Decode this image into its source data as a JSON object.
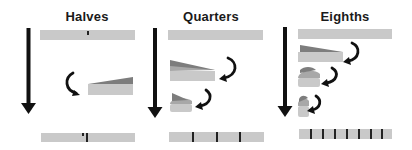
{
  "panels": [
    {
      "id": "halves",
      "title": "Halves",
      "divisions": 2
    },
    {
      "id": "quarters",
      "title": "Quarters",
      "divisions": 4
    },
    {
      "id": "eighths",
      "title": "Eighths",
      "divisions": 8
    }
  ],
  "colors": {
    "strip_light": "#c9c9c9",
    "strip_dark": "#7d7d7d",
    "ink": "#111111"
  },
  "icons": [
    "down-arrow-icon",
    "curved-fold-arrow-icon"
  ]
}
